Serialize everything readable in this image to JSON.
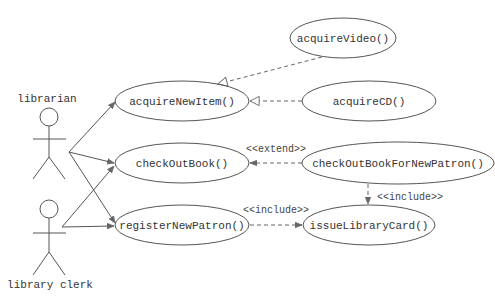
{
  "diagram": {
    "type": "UML use case diagram",
    "actors": [
      {
        "id": "librarian",
        "label": "librarian"
      },
      {
        "id": "library_clerk",
        "label": "library clerk"
      }
    ],
    "use_cases": [
      {
        "id": "acquireVideo",
        "label": "acquireVideo()"
      },
      {
        "id": "acquireNewItem",
        "label": "acquireNewItem()"
      },
      {
        "id": "acquireCD",
        "label": "acquireCD()"
      },
      {
        "id": "checkOutBook",
        "label": "checkOutBook()"
      },
      {
        "id": "checkOutBookForNewPatron",
        "label": "checkOutBookForNewPatron()"
      },
      {
        "id": "registerNewPatron",
        "label": "registerNewPatron()"
      },
      {
        "id": "issueLibraryCard",
        "label": "issueLibraryCard()"
      }
    ],
    "relationships": [
      {
        "from": "librarian",
        "to": "acquireNewItem",
        "type": "association"
      },
      {
        "from": "librarian",
        "to": "checkOutBook",
        "type": "association"
      },
      {
        "from": "librarian",
        "to": "registerNewPatron",
        "type": "association"
      },
      {
        "from": "library_clerk",
        "to": "checkOutBook",
        "type": "association"
      },
      {
        "from": "library_clerk",
        "to": "registerNewPatron",
        "type": "association"
      },
      {
        "from": "acquireVideo",
        "to": "acquireNewItem",
        "type": "generalization"
      },
      {
        "from": "acquireCD",
        "to": "acquireNewItem",
        "type": "generalization"
      },
      {
        "from": "checkOutBookForNewPatron",
        "to": "checkOutBook",
        "type": "extend",
        "label": "<<extend>>"
      },
      {
        "from": "checkOutBookForNewPatron",
        "to": "issueLibraryCard",
        "type": "include",
        "label": "<<include>>"
      },
      {
        "from": "registerNewPatron",
        "to": "issueLibraryCard",
        "type": "include",
        "label": "<<include>>"
      }
    ],
    "stereotypes": {
      "extend": "<<extend>>",
      "include_vertical": "<<include>>",
      "include_horizontal": "<<include>>"
    }
  }
}
